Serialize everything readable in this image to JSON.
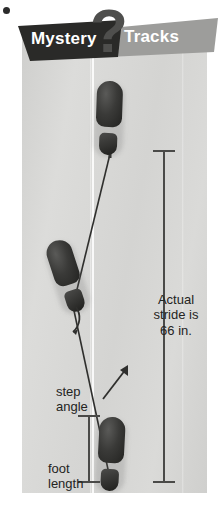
{
  "banner": {
    "left_label": "Mystery",
    "right_label": "Tracks",
    "question_mark": "?",
    "left_color": "#2a2a28",
    "right_color": "#9d9d9b",
    "question_color": "#4f4f4d"
  },
  "panel": {
    "background_color": "#d6d6d4",
    "walking_line_color": "#ffffff"
  },
  "footprints": [
    {
      "name": "top-footprint",
      "position": "top"
    },
    {
      "name": "middle-footprint",
      "position": "middle"
    },
    {
      "name": "bottom-footprint",
      "position": "bottom"
    }
  ],
  "labels": {
    "stride": {
      "line1": "Actual",
      "line2": "stride is",
      "line3": "66 in."
    },
    "step_angle": {
      "line1": "step",
      "line2": "angle"
    },
    "foot_length": {
      "line1": "foot",
      "line2": "length"
    }
  },
  "measurements": [
    {
      "name": "stride-measure-bar",
      "value": "66 in."
    },
    {
      "name": "foot-length-measure-bar",
      "value": ""
    }
  ],
  "colors": {
    "ink": "#242422",
    "measure_bar": "#4a4a48",
    "footprint_dark": "#222220"
  }
}
